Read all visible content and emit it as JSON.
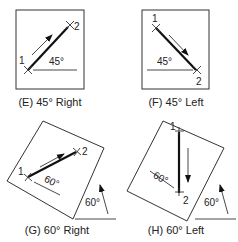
{
  "panels": [
    {
      "id": "E",
      "caption": "(E) 45° Right",
      "angle_label": "45°",
      "point1": "1",
      "point2": "2"
    },
    {
      "id": "F",
      "caption": "(F) 45° Left",
      "angle_label": "45°",
      "point1": "1",
      "point2": "2"
    },
    {
      "id": "G",
      "caption": "(G) 60° Right",
      "angle_label": "60°",
      "point1": "1",
      "point2": "2",
      "ref_angle_label": "60°"
    },
    {
      "id": "H",
      "caption": "(H) 60° Left",
      "angle_label": "60°",
      "point1": "1",
      "point2": "2",
      "ref_angle_label": "60°"
    }
  ],
  "colors": {
    "line": "#333333",
    "thick": "#111111",
    "background": "#ffffff"
  }
}
